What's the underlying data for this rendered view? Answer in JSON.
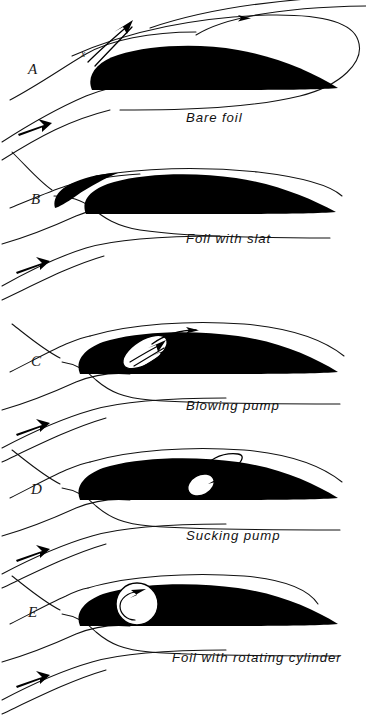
{
  "figure": {
    "background_color": "#ffffff",
    "ink_color": "#000000",
    "width": 366,
    "height": 717
  },
  "panels": [
    {
      "letter": "A",
      "caption": "Bare foil",
      "annotation": "x",
      "device": "none",
      "letter_pos": {
        "x": 28,
        "y": 74
      },
      "caption_pos": {
        "x": 186,
        "y": 122
      },
      "annotation_pos": {
        "x": 81,
        "y": 57
      }
    },
    {
      "letter": "B",
      "caption": "Foil with slat",
      "device": "slat",
      "letter_pos": {
        "x": 31,
        "y": 204
      },
      "caption_pos": {
        "x": 186,
        "y": 243
      }
    },
    {
      "letter": "C",
      "caption": "Blowing pump",
      "device": "blowing-pump",
      "letter_pos": {
        "x": 31,
        "y": 366
      },
      "caption_pos": {
        "x": 186,
        "y": 410
      }
    },
    {
      "letter": "D",
      "caption": "Sucking pump",
      "device": "sucking-pump",
      "letter_pos": {
        "x": 31,
        "y": 494
      },
      "caption_pos": {
        "x": 186,
        "y": 540
      }
    },
    {
      "letter": "E",
      "caption": "Foil with rotating cylinder",
      "device": "rotating-cylinder",
      "letter_pos": {
        "x": 28,
        "y": 617
      },
      "caption_pos": {
        "x": 172,
        "y": 662
      }
    }
  ]
}
